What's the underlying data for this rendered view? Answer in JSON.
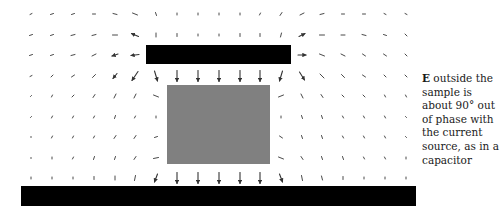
{
  "caption": {
    "symbol": "E",
    "text": " outside the sample is about 90° out of phase with the current source, as in a capacitor"
  },
  "colors": {
    "plate": "#000000",
    "sample": "#808080",
    "arrow": "#333333",
    "background": "#ffffff"
  },
  "shapes": {
    "top_plate": {
      "x": 146,
      "y": 45,
      "w": 145,
      "h": 19
    },
    "sample": {
      "x": 167,
      "y": 85,
      "w": 103,
      "h": 79
    },
    "bottom_plate": {
      "x": 21,
      "y": 186,
      "w": 395,
      "h": 20
    }
  },
  "grid": {
    "x": [
      31,
      52,
      73,
      94,
      115,
      135,
      156,
      177,
      198,
      219,
      240,
      260,
      281,
      302,
      322,
      343,
      364,
      385,
      406
    ],
    "y": [
      14,
      35,
      55,
      76,
      96,
      117,
      137,
      158,
      178
    ]
  },
  "vectors": [
    [
      [
        -2,
        1
      ],
      [
        -3,
        1
      ],
      [
        -3,
        1
      ],
      [
        -3,
        0
      ],
      [
        -4,
        -1
      ],
      [
        -5,
        -2
      ],
      [
        -1,
        -3
      ],
      [
        0,
        -2
      ],
      [
        0,
        -2
      ],
      [
        0,
        -2
      ],
      [
        0,
        -2
      ],
      [
        1,
        -2
      ],
      [
        2,
        -3
      ],
      [
        4,
        -2
      ],
      [
        4,
        -1
      ],
      [
        3,
        0
      ],
      [
        3,
        0
      ],
      [
        2,
        1
      ],
      [
        2,
        1
      ]
    ],
    [
      [
        -3,
        1
      ],
      [
        -3,
        1
      ],
      [
        -4,
        1
      ],
      [
        -4,
        1
      ],
      [
        -5,
        0
      ],
      [
        -7,
        -3
      ],
      [
        0,
        -4
      ],
      [
        0,
        -3
      ],
      [
        0,
        -2
      ],
      [
        0,
        -2
      ],
      [
        0,
        -3
      ],
      [
        0,
        -3
      ],
      [
        1,
        -4
      ],
      [
        6,
        -3
      ],
      [
        5,
        0
      ],
      [
        4,
        0
      ],
      [
        4,
        1
      ],
      [
        3,
        1
      ],
      [
        2,
        2
      ]
    ],
    [
      [
        -3,
        1
      ],
      [
        -3,
        1
      ],
      [
        -4,
        1
      ],
      [
        -4,
        2
      ],
      [
        -6,
        2
      ],
      [
        -8,
        1
      ],
      null,
      null,
      null,
      null,
      null,
      null,
      null,
      [
        8,
        0
      ],
      [
        5,
        2
      ],
      [
        4,
        2
      ],
      [
        3,
        2
      ],
      [
        3,
        2
      ],
      [
        2,
        2
      ]
    ],
    [
      [
        -2,
        1
      ],
      [
        -2,
        2
      ],
      [
        -3,
        2
      ],
      [
        -3,
        3
      ],
      [
        -4,
        5
      ],
      [
        -6,
        9
      ],
      [
        3,
        10
      ],
      [
        0,
        11
      ],
      [
        0,
        11
      ],
      [
        0,
        11
      ],
      [
        0,
        11
      ],
      [
        0,
        11
      ],
      [
        -3,
        10
      ],
      [
        5,
        8
      ],
      [
        4,
        4
      ],
      [
        3,
        3
      ],
      [
        3,
        2
      ],
      [
        2,
        2
      ],
      [
        2,
        2
      ]
    ],
    [
      [
        -1,
        1
      ],
      [
        -1,
        2
      ],
      [
        -2,
        2
      ],
      [
        -2,
        3
      ],
      [
        -2,
        4
      ],
      [
        -2,
        4
      ],
      [
        5,
        2
      ],
      null,
      null,
      null,
      null,
      null,
      [
        -5,
        2
      ],
      [
        2,
        4
      ],
      [
        2,
        3
      ],
      [
        2,
        2
      ],
      [
        2,
        2
      ],
      [
        1,
        2
      ],
      [
        1,
        2
      ]
    ],
    [
      [
        -1,
        1
      ],
      [
        -1,
        2
      ],
      [
        -1,
        2
      ],
      [
        -1,
        2
      ],
      [
        -1,
        3
      ],
      [
        -1,
        2
      ],
      [
        0,
        2
      ],
      null,
      null,
      null,
      null,
      null,
      [
        0,
        2
      ],
      [
        1,
        3
      ],
      [
        1,
        3
      ],
      [
        1,
        2
      ],
      [
        1,
        2
      ],
      [
        1,
        2
      ],
      [
        1,
        1
      ]
    ],
    [
      [
        0,
        1
      ],
      [
        -1,
        2
      ],
      [
        -1,
        2
      ],
      [
        -1,
        2
      ],
      [
        -2,
        3
      ],
      [
        -2,
        3
      ],
      [
        -3,
        1
      ],
      null,
      null,
      null,
      null,
      null,
      [
        3,
        2
      ],
      [
        1,
        3
      ],
      [
        1,
        3
      ],
      [
        1,
        2
      ],
      [
        1,
        2
      ],
      [
        1,
        2
      ],
      [
        1,
        1
      ]
    ],
    [
      [
        0,
        1
      ],
      [
        0,
        2
      ],
      [
        -1,
        2
      ],
      [
        -1,
        3
      ],
      [
        -1,
        3
      ],
      [
        -2,
        3
      ],
      [
        -5,
        1
      ],
      null,
      null,
      null,
      null,
      null,
      [
        5,
        2
      ],
      [
        2,
        3
      ],
      [
        1,
        3
      ],
      [
        1,
        3
      ],
      [
        1,
        2
      ],
      [
        1,
        2
      ],
      [
        0,
        2
      ]
    ],
    [
      [
        0,
        2
      ],
      [
        0,
        2
      ],
      [
        0,
        2
      ],
      [
        0,
        3
      ],
      [
        0,
        4
      ],
      [
        -1,
        5
      ],
      [
        -3,
        8
      ],
      [
        0,
        11
      ],
      [
        0,
        11
      ],
      [
        0,
        11
      ],
      [
        0,
        11
      ],
      [
        0,
        11
      ],
      [
        3,
        8
      ],
      [
        1,
        5
      ],
      [
        1,
        4
      ],
      [
        0,
        3
      ],
      [
        0,
        2
      ],
      [
        0,
        2
      ],
      [
        0,
        2
      ]
    ]
  ]
}
